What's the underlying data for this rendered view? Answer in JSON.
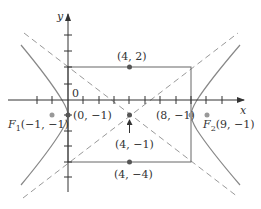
{
  "colors": {
    "axis": "#333333",
    "curve": "#888888",
    "asymptote": "#999999",
    "rectangle": "#666666",
    "point": "#555555",
    "focus": "#999999",
    "text": "#333333"
  },
  "axes": {
    "x_label": "x",
    "y_label": "y",
    "origin_label": "0",
    "unit_px": 15.4,
    "x_ticks": [
      -2,
      -1,
      1,
      2,
      3,
      4,
      5,
      6,
      7,
      8,
      9,
      10
    ],
    "y_ticks": [
      4,
      3,
      2,
      1,
      -1,
      -2,
      -3,
      -4,
      -5
    ]
  },
  "hyperbola": {
    "center": [
      4,
      -1
    ],
    "a": 4,
    "b": 3,
    "c": 5,
    "orientation": "horizontal"
  },
  "points": {
    "center": {
      "label": "(4, −1)",
      "coords": [
        4,
        -1
      ]
    },
    "vertex_left": {
      "label": "(0, −1)",
      "coords": [
        0,
        -1
      ]
    },
    "vertex_right": {
      "label": "(8, −1)",
      "coords": [
        8,
        -1
      ]
    },
    "co_vertex_top": {
      "label": "(4, 2)",
      "coords": [
        4,
        2
      ]
    },
    "co_vertex_bottom": {
      "label": "(4, −4)",
      "coords": [
        4,
        -4
      ]
    },
    "focus_left": {
      "name": "F",
      "subscript": "1",
      "label": "(−1, −1)",
      "coords": [
        -1,
        -1
      ]
    },
    "focus_right": {
      "name": "F",
      "subscript": "2",
      "label": "(9, −1)",
      "coords": [
        9,
        -1
      ]
    }
  }
}
